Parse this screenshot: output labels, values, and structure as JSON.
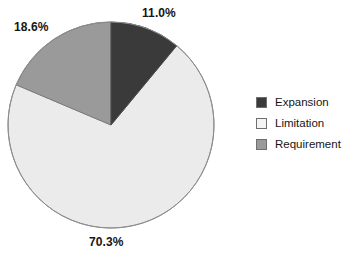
{
  "chart_data": {
    "type": "pie",
    "title": "",
    "categories": [
      "Expansion",
      "Limitation",
      "Requirement"
    ],
    "values": [
      11.0,
      70.3,
      18.6
    ],
    "value_unit": "%",
    "data_labels": [
      "11.0%",
      "70.3%",
      "18.6%"
    ],
    "colors": [
      "#3a3a3a",
      "#ebebeb",
      "#9a9a9a"
    ],
    "start_angle_deg": 0,
    "direction": "clockwise",
    "legend_position": "right",
    "grid": false,
    "xlabel": "",
    "ylabel": ""
  },
  "pie": {
    "slices": [
      {
        "name": "Expansion",
        "percent_label": "11.0%",
        "value": 11.0,
        "color": "#3a3a3a",
        "stroke": "#4a4a4a"
      },
      {
        "name": "Limitation",
        "percent_label": "70.3%",
        "value": 70.3,
        "color": "#ebebeb",
        "stroke": "#8d8d8d"
      },
      {
        "name": "Requirement",
        "percent_label": "18.6%",
        "value": 18.6,
        "color": "#9a9a9a",
        "stroke": "#7c7c7c"
      }
    ]
  },
  "labels": {
    "expansion_pct": "11.0%",
    "limitation_pct": "70.3%",
    "requirement_pct": "18.6%"
  },
  "legend": {
    "items": [
      {
        "label": "Expansion",
        "color": "#3a3a3a"
      },
      {
        "label": "Limitation",
        "color": "#f2f2f2"
      },
      {
        "label": "Requirement",
        "color": "#9a9a9a"
      }
    ]
  }
}
